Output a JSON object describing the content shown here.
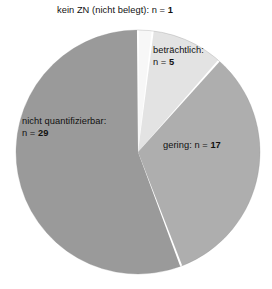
{
  "chart_data": {
    "type": "pie",
    "title": "",
    "subtitle": "",
    "xlabel": "",
    "ylabel": "",
    "legend_position": "none",
    "grid": false,
    "total": 52,
    "unit_prefix": "n = ",
    "categories": [
      "kein ZN (nicht belegt)",
      "beträchtlich",
      "gering",
      "nicht quantifizierbar"
    ],
    "values": [
      1,
      5,
      17,
      29
    ],
    "colors": [
      "#f7f7f7",
      "#e3e3e3",
      "#aeaeae",
      "#9a9a9a"
    ],
    "start_angle_deg": 0,
    "direction": "clockwise",
    "slices": [
      {
        "name": "kein ZN (nicht belegt)",
        "value": 1,
        "percent": 1.9,
        "angle_deg": 6.9,
        "color": "#f7f7f7",
        "label_text": "kein ZN (nicht belegt): n = ",
        "label_value": "1",
        "label_lines": [
          "kein ZN (nicht belegt): n = 1"
        ]
      },
      {
        "name": "beträchtlich",
        "value": 5,
        "percent": 9.6,
        "angle_deg": 34.6,
        "color": "#e3e3e3",
        "label_text": "beträchtlich:",
        "label_value": "5",
        "label_lines": [
          "beträchtlich:",
          "n = 5"
        ]
      },
      {
        "name": "gering",
        "value": 17,
        "percent": 32.7,
        "angle_deg": 117.7,
        "color": "#aeaeae",
        "label_text": "gering: n = ",
        "label_value": "17",
        "label_lines": [
          "gering: n = 17"
        ]
      },
      {
        "name": "nicht quantifizierbar",
        "value": 29,
        "percent": 55.8,
        "angle_deg": 200.8,
        "color": "#9a9a9a",
        "label_text": "nicht quantifizierbar:",
        "label_value": "29",
        "label_lines": [
          "nicht quantifizierbar:",
          "n = 29"
        ]
      }
    ]
  },
  "labels": {
    "kein_zn": {
      "prefix": "kein ZN (nicht belegt): n = ",
      "value": "1"
    },
    "betraechtlich": {
      "line1": "beträchtlich:",
      "prefix": "n = ",
      "value": "5"
    },
    "gering": {
      "prefix": "gering: n = ",
      "value": "17"
    },
    "nicht_quantifizierbar": {
      "line1": "nicht quantifizierbar:",
      "prefix": "n = ",
      "value": "29"
    }
  },
  "style": {
    "background": "#ffffff",
    "text_color": "#111111",
    "separator_color": "#ffffff",
    "outline_color": "#8f8f8f"
  }
}
